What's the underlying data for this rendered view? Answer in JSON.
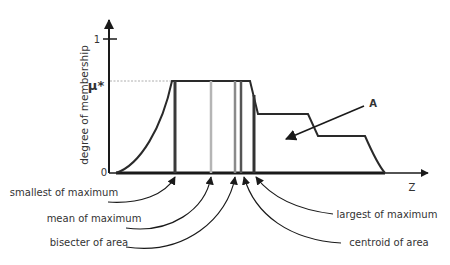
{
  "diagram": {
    "y_axis": {
      "label": "degree of membership",
      "tick_top": "1",
      "tick_mu": "μ*",
      "tick_zero": "0"
    },
    "x_axis": {
      "label": "Z"
    },
    "set_label": "A",
    "annotations": [
      {
        "id": "som",
        "label": "smallest of maximum"
      },
      {
        "id": "mom",
        "label": "mean of maximum"
      },
      {
        "id": "boa",
        "label": "bisecter of area"
      },
      {
        "id": "lom",
        "label": "largest of maximum"
      },
      {
        "id": "coa",
        "label": "centroid of area"
      }
    ],
    "colors": {
      "axis": "#1a1a1a",
      "curve": "#2a2a2a",
      "som_line": "#3a3a3a",
      "mom_line": "#b5b5b5",
      "boa_line": "#8a8a8a",
      "coa_line": "#555555",
      "lom_line": "#333333",
      "mu_dotted": "#999999"
    }
  }
}
